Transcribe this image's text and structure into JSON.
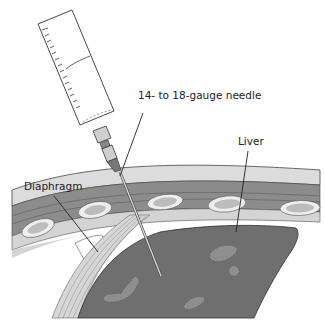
{
  "figure": {
    "labels": {
      "needle": "14- to 18-gauge needle",
      "diaphragm": "Diaphragm",
      "liver": "Liver"
    },
    "colors": {
      "background": "#ffffff",
      "skin": "#d9d9d9",
      "muscle": "#8a8a8a",
      "rib": "#e8e8e8",
      "rib_inner": "#bdbdbd",
      "liver": "#6e6e6e",
      "lesion": "#8e8e8e",
      "pleura": "#cfcfcf",
      "outline": "#333333"
    }
  }
}
